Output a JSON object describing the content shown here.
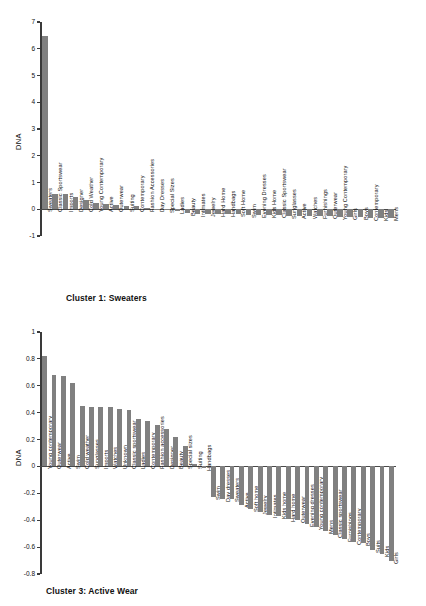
{
  "figure": {
    "bar_color": "#808080",
    "axis_color": "#3a3a3a",
    "background": "#ffffff"
  },
  "chart_data": [
    {
      "type": "bar",
      "title": "Cluster 1: Sweaters",
      "xlabel": "",
      "ylabel": "DNA",
      "ylim": [
        -1,
        7
      ],
      "yticks": [
        -1,
        0,
        1,
        2,
        3,
        4,
        5,
        6,
        7
      ],
      "ytick_labels": [
        "-1",
        "0",
        "1",
        "2",
        "3",
        "4",
        "5",
        "6",
        "7"
      ],
      "grid": false,
      "legend": null,
      "categories": [
        "Sweaters",
        "Classic Sportswear",
        "Imports",
        "Designer",
        "Cold Weather",
        "Young Contemporary",
        "Active",
        "Outerwear",
        "Suiting",
        "Contemporary",
        "Fashion Accessories",
        "Day Dresses",
        "Special Sizes",
        "Ladies",
        "Beauty",
        "Intimates",
        "Jewelry",
        "Hard Home",
        "Handbags",
        "Soft Home",
        "Swim",
        "Evening Dresses",
        "Kids Home",
        "Classic Sportswear",
        "Sunglasses",
        "Active",
        "Watches",
        "Furnishings",
        "Outerwear",
        "Young Contemporary",
        "Girls",
        "Boys",
        "Contemporary",
        "Kids",
        "Mens"
      ],
      "values": [
        6.47,
        0.57,
        0.56,
        0.44,
        0.34,
        0.25,
        0.18,
        0.15,
        0.13,
        0.12,
        0.06,
        0.02,
        -0.02,
        -0.06,
        -0.15,
        -0.16,
        -0.17,
        -0.18,
        -0.19,
        -0.19,
        -0.2,
        -0.21,
        -0.22,
        -0.23,
        -0.24,
        -0.25,
        -0.25,
        -0.26,
        -0.27,
        -0.29,
        -0.3,
        -0.3,
        -0.31,
        -0.32,
        -0.33
      ]
    },
    {
      "type": "bar",
      "title": "Cluster 3: Active Wear",
      "xlabel": "",
      "ylabel": "DNA",
      "ylim": [
        -0.8,
        1.0
      ],
      "yticks": [
        -0.8,
        -0.6,
        -0.4,
        -0.2,
        0,
        0.2,
        0.4,
        0.6,
        0.8,
        1.0
      ],
      "ytick_labels": [
        "-0.8",
        "-0.6",
        "-0.4",
        "-0.2",
        "0",
        "0.2",
        "0.4",
        "0.6",
        "0.8",
        "1"
      ],
      "grid": false,
      "legend": null,
      "categories": [
        "Young contemporary",
        "Outerwear",
        "Active",
        "Swim",
        "Cold weather",
        "Sunglasses",
        "Imports",
        "Watches",
        "Unknown",
        "Classic sportswear",
        "Ladies",
        "Contemporary",
        "Fashion accessories",
        "Designer",
        "Beauty",
        "Special sizes",
        "Suiting",
        "Handbags",
        "Swim",
        "Day dresses",
        "Sweaters",
        "Active",
        "Soft home",
        "Jewelry",
        "Intimates",
        "Kids home",
        "Hard home",
        "Outerwear",
        "Evening dresses",
        "Young contemporary",
        "Mens",
        "Classic sportswear",
        "Furnishings",
        "Contemporary",
        "Boys",
        "Suits",
        "Kids",
        "Girls"
      ],
      "values": [
        0.82,
        0.68,
        0.67,
        0.62,
        0.45,
        0.44,
        0.44,
        0.44,
        0.43,
        0.42,
        0.35,
        0.34,
        0.31,
        0.28,
        0.22,
        0.15,
        0.02,
        -0.01,
        -0.23,
        -0.24,
        -0.24,
        -0.29,
        -0.32,
        -0.34,
        -0.36,
        -0.37,
        -0.39,
        -0.4,
        -0.43,
        -0.45,
        -0.48,
        -0.51,
        -0.54,
        -0.56,
        -0.57,
        -0.62,
        -0.65,
        -0.7
      ]
    }
  ]
}
